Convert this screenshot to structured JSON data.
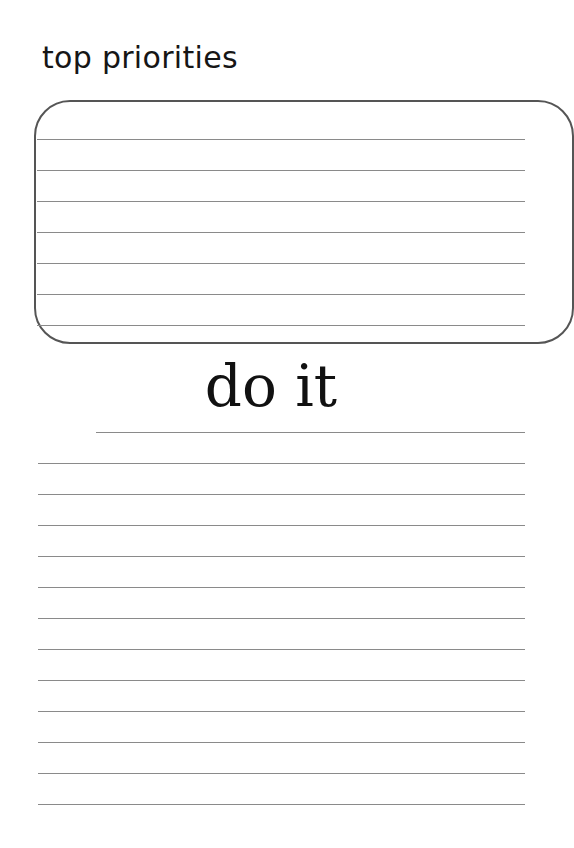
{
  "page": {
    "title": "top priorities",
    "section_heading": "do it",
    "box_rule_count": 7,
    "bottom_rule_count": 13,
    "colors": {
      "text": "#161616",
      "rule": "#8a8a8a",
      "box_border": "#555555"
    }
  }
}
